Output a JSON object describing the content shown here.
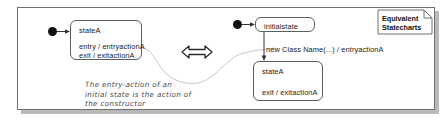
{
  "diagram": {
    "title": "Equivalent Statecharts",
    "note": {
      "line1": "Equivalent",
      "line2": "Statecharts"
    },
    "left_panel": {
      "initial_pseudostate": "initial-state-dot",
      "state": {
        "name": "stateA",
        "entry_action": "entry / entryactionA",
        "exit_action": "exit / exitactionA"
      },
      "annotation": {
        "line1": "The entry-action of an",
        "line2": "initial state is the action of",
        "line3": "the constructor"
      }
    },
    "equivalence_symbol": "double-headed-arrow",
    "right_panel": {
      "initial_pseudostate": "initial-state-dot",
      "initial_state": {
        "name": "initialstate"
      },
      "transition": {
        "label": "new Class Name(...) / entryactionA"
      },
      "state": {
        "name": "stateA",
        "exit_action": "exit / exitactionA"
      }
    },
    "colors": {
      "line": "#5e5e5e",
      "frame": "#6f6f6f",
      "shadow": "#b9b9b9",
      "text": "#1a1a1a",
      "annotation_text": "#4c4c4c",
      "leader_line": "#c3c3c3",
      "dot": "#111111",
      "background": "#ffffff"
    }
  }
}
